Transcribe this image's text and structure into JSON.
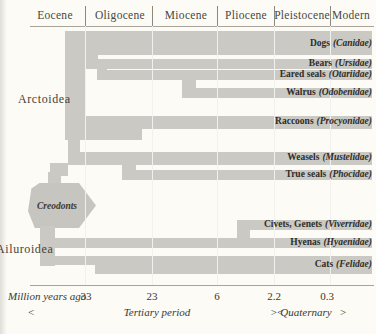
{
  "header": {
    "epochs": [
      "Eocene",
      "Oligocene",
      "Miocene",
      "Pliocene",
      "Pleistocene",
      "Modern"
    ]
  },
  "groups": {
    "arctoidea": "Arctoidea",
    "creodonts": "Creodonts",
    "ailuroidea": "Ailuroidea"
  },
  "families": [
    {
      "common": "Dogs",
      "latin": "(Canidae)"
    },
    {
      "common": "Bears",
      "latin": "(Ursidae)"
    },
    {
      "common": "Eared seals",
      "latin": "(Otariidae)"
    },
    {
      "common": "Walrus",
      "latin": "(Odobenidae)"
    },
    {
      "common": "Raccoons",
      "latin": "(Procyonidae)"
    },
    {
      "common": "Weasels",
      "latin": "(Mustelidae)"
    },
    {
      "common": "True seals",
      "latin": "(Phocidae)"
    },
    {
      "common": "Civets, Genets",
      "latin": "(Viverridae)"
    },
    {
      "common": "Hyenas",
      "latin": "(Hyaenidae)"
    },
    {
      "common": "Cats",
      "latin": "(Felidae)"
    }
  ],
  "axis": {
    "caption": "Million years ago",
    "ticks": [
      "33",
      "23",
      "6",
      "2.2",
      "0.3"
    ],
    "left_arrow": "<",
    "tertiary": "Tertiary period",
    "boundary_arrows": "><",
    "quaternary": "Quaternary",
    "right_arrow": ">"
  },
  "colors": {
    "band": "#cac9c4",
    "background": "#fcfbf6",
    "text": "#38352e"
  }
}
